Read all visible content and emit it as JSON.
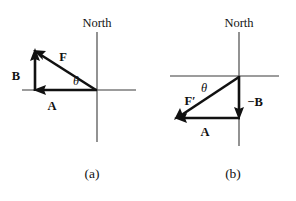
{
  "figure": {
    "background_color": "#ffffff",
    "ink_color": "#111111",
    "axis_color": "#3a3a3a"
  },
  "panels": [
    {
      "id": "a",
      "caption": "(a)",
      "north_label": "North",
      "origin": {
        "x": 97,
        "y": 90
      },
      "axes": {
        "vertical": {
          "x": 97,
          "y1": 32,
          "y2": 142
        },
        "horizontal": {
          "y": 90,
          "x1": 22,
          "x2": 136
        }
      },
      "vectors": [
        {
          "name": "A",
          "label": "A",
          "label_pos": {
            "x": 52,
            "y": 108
          },
          "from": {
            "x": 97,
            "y": 90
          },
          "to": {
            "x": 35,
            "y": 90
          },
          "direction": "west"
        },
        {
          "name": "B",
          "label": "B",
          "label_pos": {
            "x": 16,
            "y": 78
          },
          "from": {
            "x": 35,
            "y": 90
          },
          "to": {
            "x": 35,
            "y": 50
          },
          "direction": "north"
        },
        {
          "name": "F",
          "label": "F",
          "label_pos": {
            "x": 62,
            "y": 60
          },
          "from": {
            "x": 97,
            "y": 90
          },
          "to": {
            "x": 35,
            "y": 50
          },
          "direction": "northwest"
        }
      ],
      "angle": {
        "label": "θ",
        "label_pos": {
          "x": 75,
          "y": 84
        }
      }
    },
    {
      "id": "b",
      "caption": "(b)",
      "north_label": "North",
      "origin": {
        "x": 239,
        "y": 76
      },
      "axes": {
        "vertical": {
          "x": 239,
          "y1": 32,
          "y2": 146
        },
        "horizontal": {
          "y": 76,
          "x1": 170,
          "x2": 279
        }
      },
      "vectors": [
        {
          "name": "A",
          "label": "A",
          "label_pos": {
            "x": 204,
            "y": 134
          },
          "from": {
            "x": 239,
            "y": 118
          },
          "to": {
            "x": 176,
            "y": 118
          },
          "direction": "west"
        },
        {
          "name": "-B",
          "label": "−B",
          "label_pos": {
            "x": 246,
            "y": 104
          },
          "from": {
            "x": 239,
            "y": 76
          },
          "to": {
            "x": 239,
            "y": 118
          },
          "direction": "south"
        },
        {
          "name": "F-prime",
          "label": "F′",
          "label_pos": {
            "x": 188,
            "y": 103
          },
          "from": {
            "x": 239,
            "y": 76
          },
          "to": {
            "x": 176,
            "y": 118
          },
          "direction": "southwest"
        }
      ],
      "angle": {
        "label": "θ",
        "label_pos": {
          "x": 203,
          "y": 91
        }
      }
    }
  ],
  "captions": {
    "a": {
      "text": "(a)",
      "x": 92,
      "y": 176
    },
    "b": {
      "text": "(b)",
      "x": 233,
      "y": 176
    }
  },
  "north_labels": {
    "a": {
      "text": "North",
      "x": 97,
      "y": 27
    },
    "b": {
      "text": "North",
      "x": 239,
      "y": 27
    }
  }
}
